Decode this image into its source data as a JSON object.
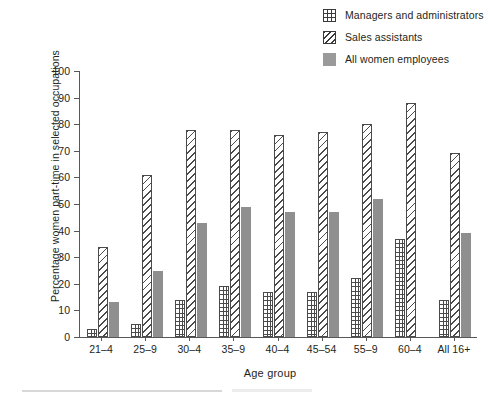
{
  "chart_data": {
    "type": "bar",
    "title": "",
    "xlabel": "Age group",
    "ylabel": "Percentage women part-time in selected occupations",
    "ylim": [
      0,
      100
    ],
    "ytick_step": 10,
    "yticks": [
      "0",
      "10",
      "20",
      "30",
      "40",
      "50",
      "60",
      "70",
      "80",
      "90",
      "100"
    ],
    "grid": false,
    "legend_position": "top-right",
    "categories": [
      "21–4",
      "25–9",
      "30–4",
      "35–9",
      "40–4",
      "45–54",
      "55–9",
      "60–4",
      "All 16+"
    ],
    "series": [
      {
        "name": "Managers and administrators",
        "pattern": "grid-hatch",
        "values": [
          3,
          5,
          14,
          19,
          17,
          17,
          22,
          37,
          14
        ]
      },
      {
        "name": "Sales assistants",
        "pattern": "diagonal-hatch",
        "values": [
          34,
          61,
          78,
          78,
          76,
          77,
          80,
          88,
          69
        ]
      },
      {
        "name": "All women employees",
        "pattern": "solid-grey",
        "values": [
          13,
          25,
          43,
          49,
          47,
          47,
          52,
          null,
          39
        ]
      }
    ]
  },
  "legend": {
    "items": [
      {
        "label": "Managers and administrators",
        "swatch": "grid-hatch-swatch"
      },
      {
        "label": "Sales assistants",
        "swatch": "diagonal-hatch-swatch"
      },
      {
        "label": "All women employees",
        "swatch": "solid-grey-swatch"
      }
    ]
  },
  "colors": {
    "ink": "#231f20",
    "axis": "#58585a",
    "bar_outline": "#4a4a4a",
    "all_women_fill": "#8f8f8f",
    "background": "#ffffff"
  }
}
